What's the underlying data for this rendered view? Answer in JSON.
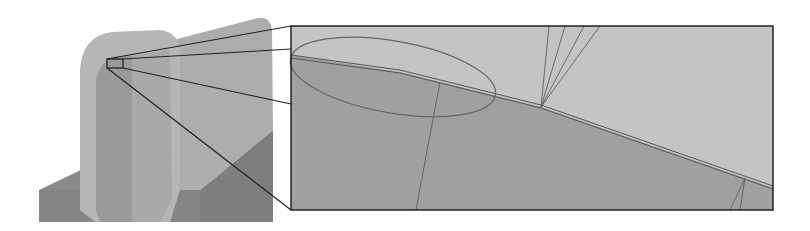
{
  "figure": {
    "type": "cad-mesh-zoom-illustration",
    "colors": {
      "background": "#ffffff",
      "model_light": "#bdbdbd",
      "model_mid": "#a6a6a6",
      "model_dark": "#8c8c8c",
      "model_shadow": "#7a7a7a",
      "panel_upper": "#c4c4c4",
      "panel_lower": "#9f9f9f",
      "frame": "#222222",
      "mesh_line": "#555555",
      "ellipse": "#666666"
    },
    "source_region": {
      "x": 107,
      "y": 59,
      "width": 16,
      "height": 9
    },
    "zoom_panel": {
      "x": 291,
      "y": 26,
      "width": 482,
      "height": 184
    },
    "annotations": {
      "ellipse": {
        "cx": 393,
        "cy": 77,
        "rx": 104,
        "ry": 37,
        "rotation_deg": 10,
        "label": "highlighted-region"
      }
    }
  }
}
